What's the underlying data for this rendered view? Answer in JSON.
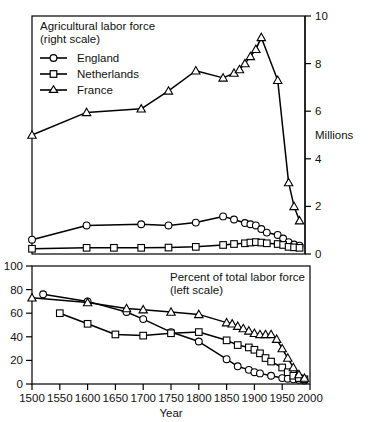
{
  "figure": {
    "x_axis_label": "Year",
    "right_axis_label": "Millions",
    "x_ticks": [
      "1500",
      "1550",
      "1600",
      "1650",
      "1700",
      "1750",
      "1800",
      "1850",
      "1900",
      "1950",
      "2000"
    ],
    "top_panel": {
      "annotation_line1": "Agricultural labor force",
      "annotation_line2": "(right scale)",
      "y_ticks": [
        "0",
        "2",
        "4",
        "6",
        "8",
        "10"
      ],
      "legend": [
        {
          "label": "England",
          "marker": "circle"
        },
        {
          "label": "Netherlands",
          "marker": "square"
        },
        {
          "label": "France",
          "marker": "triangle"
        }
      ]
    },
    "bottom_panel": {
      "annotation_line1": "Percent of total labor force",
      "annotation_line2": "(left scale)",
      "y_ticks": [
        "0",
        "20",
        "40",
        "60",
        "80",
        "100"
      ]
    },
    "colors": {
      "line": "#000000",
      "marker_fill": "#ffffff",
      "frame": "#000000",
      "text": "#111111"
    }
  },
  "chart_data": [
    {
      "type": "line",
      "panel": "top",
      "title": "Agricultural labor force (right scale)",
      "xlabel": "Year",
      "ylabel": "Millions",
      "xlim": [
        1500,
        2000
      ],
      "ylim": [
        0,
        10
      ],
      "yticks": [
        0,
        2,
        4,
        6,
        8,
        10
      ],
      "xticks": [
        1500,
        1550,
        1600,
        1650,
        1700,
        1750,
        1800,
        1850,
        1900,
        1950,
        2000
      ],
      "grid": false,
      "legend_position": "top-left inside",
      "series": [
        {
          "name": "England",
          "marker": "circle",
          "x": [
            1500,
            1600,
            1700,
            1750,
            1800,
            1850,
            1870,
            1890,
            1900,
            1910,
            1920,
            1930,
            1950,
            1960,
            1970,
            1980,
            1990
          ],
          "y": [
            0.6,
            1.2,
            1.25,
            1.2,
            1.32,
            1.58,
            1.45,
            1.3,
            1.25,
            1.2,
            1.05,
            0.9,
            0.8,
            0.65,
            0.5,
            0.4,
            0.35
          ]
        },
        {
          "name": "Netherlands",
          "marker": "square",
          "x": [
            1500,
            1600,
            1650,
            1700,
            1750,
            1800,
            1850,
            1870,
            1890,
            1900,
            1910,
            1920,
            1930,
            1950,
            1960,
            1970,
            1980,
            1990
          ],
          "y": [
            0.22,
            0.26,
            0.26,
            0.26,
            0.27,
            0.3,
            0.38,
            0.42,
            0.45,
            0.48,
            0.5,
            0.48,
            0.45,
            0.42,
            0.38,
            0.3,
            0.28,
            0.26
          ]
        },
        {
          "name": "France",
          "marker": "triangle",
          "x": [
            1500,
            1600,
            1700,
            1750,
            1800,
            1850,
            1870,
            1880,
            1890,
            1900,
            1910,
            1920,
            1950,
            1970,
            1980,
            1990
          ],
          "y": [
            5.0,
            5.95,
            6.1,
            6.85,
            7.7,
            7.4,
            7.6,
            7.75,
            8.0,
            8.3,
            8.6,
            9.1,
            7.3,
            3.0,
            2.0,
            1.4
          ]
        }
      ]
    },
    {
      "type": "line",
      "panel": "bottom",
      "title": "Percent of total labor force (left scale)",
      "xlabel": "Year",
      "ylabel": "Percent",
      "xlim": [
        1500,
        2000
      ],
      "ylim": [
        0,
        100
      ],
      "yticks": [
        0,
        20,
        40,
        60,
        80,
        100
      ],
      "xticks": [
        1500,
        1550,
        1600,
        1650,
        1700,
        1750,
        1800,
        1850,
        1900,
        1950,
        2000
      ],
      "grid": false,
      "series": [
        {
          "name": "England",
          "marker": "circle",
          "x": [
            1520,
            1600,
            1670,
            1700,
            1750,
            1800,
            1850,
            1870,
            1890,
            1900,
            1910,
            1930,
            1950,
            1960,
            1970,
            1980,
            1990
          ],
          "y": [
            76,
            70,
            61,
            55,
            44,
            36,
            21,
            15,
            12,
            10,
            9,
            7,
            5,
            4.5,
            4,
            3.5,
            3
          ]
        },
        {
          "name": "Netherlands",
          "marker": "square",
          "x": [
            1550,
            1600,
            1650,
            1700,
            1750,
            1800,
            1850,
            1870,
            1890,
            1900,
            1910,
            1920,
            1930,
            1950,
            1960,
            1970,
            1980,
            1990
          ],
          "y": [
            60,
            51,
            42,
            41,
            43,
            44,
            37,
            33,
            31,
            29,
            26,
            22,
            19,
            14,
            10,
            7,
            5,
            4
          ]
        },
        {
          "name": "France",
          "marker": "triangle",
          "x": [
            1500,
            1600,
            1670,
            1700,
            1750,
            1800,
            1850,
            1860,
            1870,
            1880,
            1890,
            1900,
            1910,
            1920,
            1930,
            1940,
            1950,
            1960,
            1970,
            1980,
            1990
          ],
          "y": [
            73,
            69,
            64,
            63,
            61,
            59,
            52,
            51,
            49,
            47,
            45,
            43,
            42,
            42,
            42,
            38,
            30,
            22,
            14,
            8,
            5
          ]
        }
      ]
    }
  ]
}
